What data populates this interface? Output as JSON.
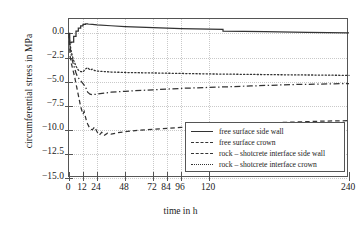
{
  "chart_data": {
    "type": "line",
    "title": "",
    "xlabel": "time in h",
    "ylabel": "circumferential stress in MPa",
    "xlim": [
      0,
      240
    ],
    "ylim": [
      -15.0,
      1.5
    ],
    "grid": true,
    "legend_position": "lower right",
    "xticks": [
      0,
      12,
      24,
      48,
      72,
      84,
      96,
      120,
      240
    ],
    "xticklabels": [
      "0",
      "12",
      "24",
      "48",
      "72",
      "84",
      "96",
      "120",
      "240"
    ],
    "yticks": [
      0.0,
      -2.5,
      -5.0,
      -7.5,
      -10.0,
      -12.5,
      -15.0
    ],
    "yticklabels": [
      "0.0",
      "−2.5",
      "−5.0",
      "−7.5",
      "−10.0",
      "−12.5",
      "−15.0"
    ],
    "series": [
      {
        "name": "free surface side wall",
        "style": "solid",
        "x": [
          0,
          0.6,
          0.6,
          2,
          2,
          4,
          4,
          6,
          6,
          8,
          8,
          10,
          10,
          12,
          12,
          14,
          14,
          16,
          16,
          20,
          24,
          36,
          48,
          72,
          96,
          120,
          132,
          132,
          168,
          204,
          240
        ],
        "y": [
          0.0,
          0.0,
          -0.95,
          -0.95,
          -0.9,
          -0.9,
          -0.3,
          -0.3,
          0.25,
          0.25,
          0.55,
          0.55,
          0.8,
          0.8,
          0.95,
          0.95,
          1.0,
          1.0,
          0.98,
          0.93,
          0.88,
          0.8,
          0.72,
          0.6,
          0.5,
          0.45,
          0.42,
          0.25,
          0.18,
          0.1,
          0.05
        ]
      },
      {
        "name": "free surface crown",
        "style": "dashed",
        "x": [
          0,
          1,
          2,
          3,
          4,
          5,
          6,
          7,
          8,
          9,
          10,
          11,
          12,
          13,
          14,
          15,
          16,
          18,
          20,
          22,
          24,
          26,
          28,
          30,
          33,
          36,
          42,
          48,
          60,
          72,
          96,
          120,
          144,
          168,
          192,
          216,
          240
        ],
        "y": [
          0.0,
          -2.4,
          -3.1,
          -3.6,
          -4.1,
          -4.6,
          -5.2,
          -5.8,
          -6.4,
          -7.0,
          -7.6,
          -8.0,
          -8.4,
          -8.1,
          -8.6,
          -9.1,
          -9.4,
          -9.9,
          -10.0,
          -9.7,
          -10.2,
          -10.55,
          -10.25,
          -10.6,
          -10.35,
          -10.45,
          -10.3,
          -10.2,
          -10.05,
          -9.95,
          -9.75,
          -9.6,
          -9.45,
          -9.3,
          -9.2,
          -9.1,
          -9.05
        ]
      },
      {
        "name": "rock – shotcrete interface side wall",
        "style": "dashdot",
        "x": [
          0,
          1,
          2,
          3,
          4,
          5,
          6,
          7,
          8,
          10,
          12,
          14,
          16,
          18,
          20,
          24,
          30,
          36,
          48,
          72,
          96,
          120,
          156,
          192,
          216,
          240
        ],
        "y": [
          0.0,
          -1.5,
          -2.3,
          -2.9,
          -3.3,
          -3.7,
          -4.1,
          -4.4,
          -4.6,
          -4.9,
          -5.2,
          -5.5,
          -6.1,
          -6.3,
          -6.35,
          -6.3,
          -6.2,
          -6.1,
          -6.0,
          -5.85,
          -5.7,
          -5.6,
          -5.45,
          -5.3,
          -5.25,
          -5.2
        ]
      },
      {
        "name": "rock – shotcrete interface crown",
        "style": "dotted",
        "x": [
          0,
          1,
          2,
          3,
          4,
          5,
          6,
          7,
          8,
          10,
          12,
          14,
          16,
          18,
          20,
          22,
          24,
          30,
          36,
          48,
          72,
          96,
          120,
          156,
          192,
          216,
          240
        ],
        "y": [
          0.0,
          -1.2,
          -1.9,
          -2.4,
          -2.8,
          -3.1,
          -3.4,
          -3.6,
          -3.8,
          -3.95,
          -4.0,
          -3.7,
          -3.55,
          -3.8,
          -3.7,
          -3.85,
          -3.9,
          -3.95,
          -4.0,
          -4.05,
          -4.1,
          -4.15,
          -4.2,
          -4.25,
          -4.3,
          -4.32,
          -4.35
        ]
      }
    ],
    "legend_entries": [
      {
        "label": "free surface side wall",
        "style": "solid"
      },
      {
        "label": "free surface crown",
        "style": "dashed"
      },
      {
        "label": "rock – shotcrete interface side wall",
        "style": "dashdot"
      },
      {
        "label": "rock – shotcrete interface crown",
        "style": "dotted"
      }
    ]
  }
}
